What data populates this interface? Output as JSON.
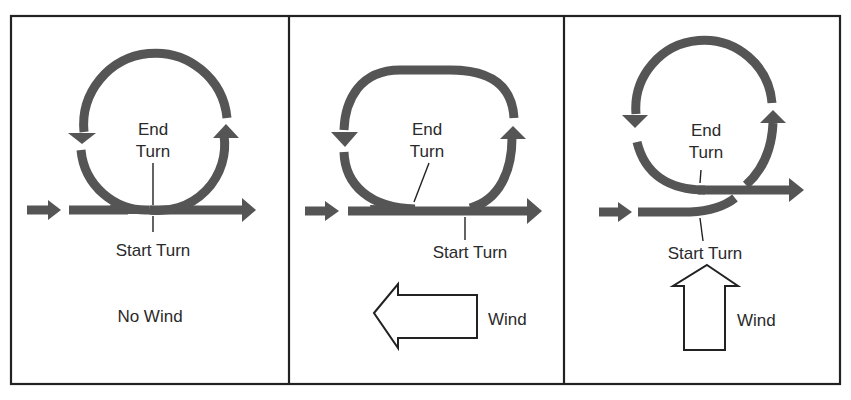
{
  "figure": {
    "colors": {
      "track": "#555555",
      "frame": "#222222",
      "text": "#2a2a2a",
      "background": "#ffffff"
    },
    "panels": [
      {
        "id": "no-wind",
        "end_label_line1": "End",
        "end_label_line2": "Turn",
        "start_label": "Start Turn",
        "wind_label": "No Wind",
        "wind_direction": "none"
      },
      {
        "id": "wind-from-right",
        "end_label_line1": "End",
        "end_label_line2": "Turn",
        "start_label": "Start Turn",
        "wind_label": "Wind",
        "wind_direction": "left"
      },
      {
        "id": "wind-from-below",
        "end_label_line1": "End",
        "end_label_line2": "Turn",
        "start_label": "Start Turn",
        "wind_label": "Wind",
        "wind_direction": "up"
      }
    ]
  }
}
